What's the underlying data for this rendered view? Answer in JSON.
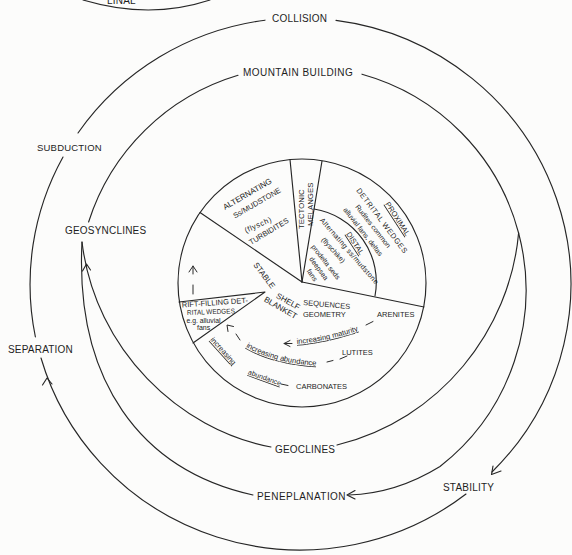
{
  "diagram": {
    "top_fragment_label": "LINAL",
    "outer_cycle": {
      "collision": "COLLISION",
      "subduction": "SUBDUCTION",
      "separation": "SEPARATION",
      "stability": "STABILITY"
    },
    "inner_cycle": {
      "mountain_building": "MOUNTAIN BUILDING",
      "geosynclines": "GEOSYNCLINES",
      "geoclines": "GEOCLINES",
      "peneplanation": "PENEPLANATION"
    },
    "pie": {
      "flysch_sector": {
        "line1": "ALTERNATING",
        "line2": "Ss/MUDSTONE",
        "line3": "(flysch)",
        "line4": "TURBIDITES"
      },
      "melange_sector": {
        "line1": "TECTONIC",
        "line2": "MELANGES"
      },
      "detrital_wedges": {
        "title": "DETRITAL WEDGES",
        "proximal": {
          "label": "PROXIMAL",
          "line1": "Rudites common",
          "line2": "alluvial fans, deltas"
        },
        "distal": {
          "label": "DISTAL",
          "line1": "Alternating ss/mudstone",
          "line2": "(flyschike)",
          "line3": "prodelta seds",
          "line4": "deepsea",
          "line5": "fans"
        }
      },
      "stable_shelf": {
        "stable": "STABLE",
        "shelf": "SHELF",
        "sequences": "SEQUENCES",
        "blanket": "BLANKET",
        "geometry": "GEOMETRY"
      },
      "rift_filling": {
        "line1": "RIFT-FILLING DET-",
        "line2": "RITAL WEDGES",
        "line3": "e.g. alluvial",
        "line4": "fans"
      },
      "lithologies": {
        "arenites": "ARENITES",
        "lutites": "LUTITES",
        "carbonates": "CARBONATES"
      },
      "trends": {
        "maturity": "increasing maturity",
        "lutite_abundance": "increasing abundance",
        "carbonate_increasing": "increasing",
        "carbonate_abundance": "abundance"
      }
    }
  }
}
